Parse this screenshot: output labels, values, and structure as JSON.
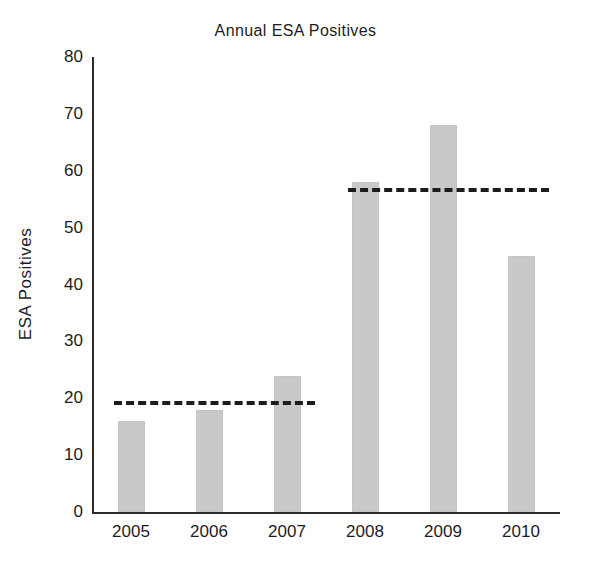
{
  "chart_data": {
    "type": "bar",
    "title": "Annual ESA Positives",
    "xlabel": "",
    "ylabel": "ESA Positives",
    "categories": [
      "2005",
      "2006",
      "2007",
      "2008",
      "2009",
      "2010"
    ],
    "values": [
      16,
      18,
      24,
      58,
      68,
      45
    ],
    "series": [
      {
        "name": "ESA Positives",
        "values": [
          16,
          18,
          24,
          58,
          68,
          45
        ]
      }
    ],
    "ylim": [
      0,
      80
    ],
    "yticks": [
      0,
      10,
      20,
      30,
      40,
      50,
      60,
      70,
      80
    ],
    "ytick_labels": [
      "0",
      "10",
      "20",
      "30",
      "40",
      "50",
      "60",
      "70",
      "80"
    ],
    "grid": false,
    "legend": false,
    "legend_position": "none",
    "bar_color": "#c9c9c9",
    "axis_color": "#2b2b2b",
    "text_color": "#1c1c1c",
    "annotations": [
      {
        "type": "dashed-reference-line",
        "label": "mean 2005-2007",
        "value": 19.5,
        "span_categories": [
          "2005",
          "2006",
          "2007"
        ],
        "color": "#1c1c1c",
        "style": "dashed"
      },
      {
        "type": "dashed-reference-line",
        "label": "mean 2008-2010",
        "value": 57,
        "span_categories": [
          "2008",
          "2009",
          "2010"
        ],
        "color": "#1c1c1c",
        "style": "dashed"
      }
    ]
  }
}
